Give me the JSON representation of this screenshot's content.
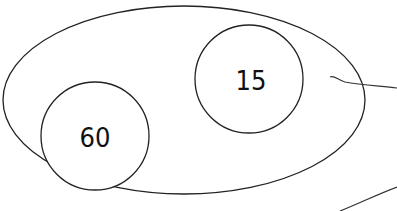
{
  "diagram": {
    "type": "venn",
    "outer_set": {
      "shape": "ellipse"
    },
    "sets": [
      {
        "id": "set-a",
        "label": "60"
      },
      {
        "id": "set-b",
        "label": "15"
      }
    ],
    "stroke_color": "#222222",
    "background": "#ffffff"
  }
}
